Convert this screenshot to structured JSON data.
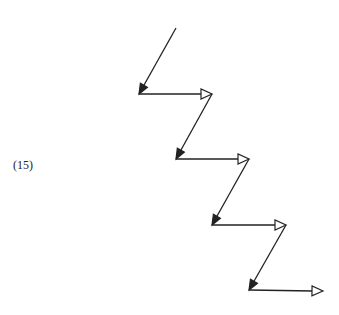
{
  "equation_label": "(15)",
  "diagram": {
    "stroke_color": "#222222",
    "start": [
      176,
      28
    ],
    "corners": [
      {
        "diag_end": [
          139,
          94
        ],
        "horiz_end": [
          212,
          94
        ]
      },
      {
        "diag_end": [
          176,
          159
        ],
        "horiz_end": [
          249,
          159
        ]
      },
      {
        "diag_end": [
          212,
          225
        ],
        "horiz_end": [
          286,
          225
        ]
      },
      {
        "diag_end": [
          249,
          290
        ],
        "horiz_end": [
          323,
          291
        ]
      }
    ],
    "diagonal_arrowhead": "filled",
    "horizontal_arrowhead": "open"
  }
}
